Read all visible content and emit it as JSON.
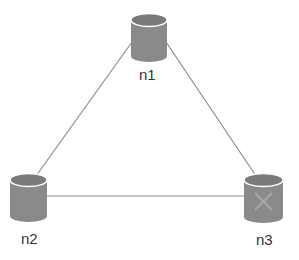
{
  "diagram": {
    "type": "network-topology",
    "nodes": [
      {
        "id": "n1",
        "label": "n1",
        "status": "ok"
      },
      {
        "id": "n2",
        "label": "n2",
        "status": "ok"
      },
      {
        "id": "n3",
        "label": "n3",
        "status": "failed"
      }
    ],
    "edges": [
      {
        "from": "n1",
        "to": "n2"
      },
      {
        "from": "n1",
        "to": "n3"
      },
      {
        "from": "n2",
        "to": "n3"
      }
    ],
    "colors": {
      "node_fill": "#8a8a8a",
      "node_top": "#7a7a7a",
      "edge": "#8c8c8c",
      "failed_mark": "#a8a8a8"
    }
  }
}
